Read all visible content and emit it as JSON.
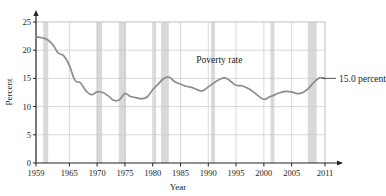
{
  "chart_data": {
    "type": "line",
    "title": "",
    "xlabel": "Year",
    "ylabel": "Percent",
    "xlim": [
      1959,
      2011
    ],
    "ylim": [
      0,
      25
    ],
    "grid": true,
    "legend": "none",
    "xticks": [
      "1959",
      "1965",
      "1970",
      "1975",
      "1980",
      "1985",
      "1990",
      "1995",
      "2000",
      "2005",
      "2011"
    ],
    "xtick_values": [
      1959,
      1965,
      1970,
      1975,
      1980,
      1985,
      1990,
      1995,
      2000,
      2005,
      2011
    ],
    "yticks": [
      "0",
      "5",
      "10",
      "15",
      "20",
      "25"
    ],
    "ytick_values": [
      0,
      5,
      10,
      15,
      20,
      25
    ],
    "series": [
      {
        "name": "Poverty rate",
        "color": "#8c8c8c",
        "x": [
          1959,
          1960,
          1961,
          1962,
          1963,
          1964,
          1965,
          1966,
          1967,
          1968,
          1969,
          1970,
          1971,
          1972,
          1973,
          1974,
          1975,
          1976,
          1977,
          1978,
          1979,
          1980,
          1981,
          1982,
          1983,
          1984,
          1985,
          1986,
          1987,
          1988,
          1989,
          1990,
          1991,
          1992,
          1993,
          1994,
          1995,
          1996,
          1997,
          1998,
          1999,
          2000,
          2001,
          2002,
          2003,
          2004,
          2005,
          2006,
          2007,
          2008,
          2009,
          2010,
          2011
        ],
        "values": [
          22.4,
          22.2,
          21.9,
          21.0,
          19.5,
          19.0,
          17.3,
          14.7,
          14.2,
          12.8,
          12.1,
          12.6,
          12.5,
          11.9,
          11.1,
          11.2,
          12.3,
          11.8,
          11.6,
          11.4,
          11.7,
          13.0,
          14.0,
          15.0,
          15.2,
          14.4,
          14.0,
          13.6,
          13.4,
          13.0,
          12.8,
          13.5,
          14.2,
          14.8,
          15.1,
          14.5,
          13.8,
          13.7,
          13.3,
          12.7,
          11.9,
          11.3,
          11.7,
          12.1,
          12.5,
          12.7,
          12.6,
          12.3,
          12.5,
          13.2,
          14.3,
          15.1,
          15.0
        ]
      }
    ],
    "shaded_bands": {
      "label": "recession",
      "color": "#d9d9d9",
      "ranges": [
        [
          1960.3,
          1961.2
        ],
        [
          1969.9,
          1970.9
        ],
        [
          1973.9,
          1975.2
        ],
        [
          1980.1,
          1980.6
        ],
        [
          1981.5,
          1982.9
        ],
        [
          1990.5,
          1991.2
        ],
        [
          2001.2,
          2001.9
        ],
        [
          2007.9,
          2009.5
        ]
      ]
    },
    "annotations": [
      {
        "name": "series-label",
        "text": "Poverty rate",
        "x": 1992.0,
        "y": 17.8
      },
      {
        "name": "endpoint-callout",
        "text": "15.0 percent",
        "x": 2012.5,
        "y": 15.0
      }
    ]
  },
  "axes": {
    "x_axis_title": "Year",
    "y_axis_title": "Percent"
  }
}
